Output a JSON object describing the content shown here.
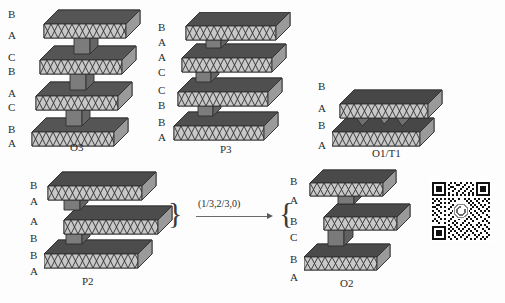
{
  "figure": {
    "background_color": "#fdfdfd",
    "polyhedra_light": "#c9c9c9",
    "polyhedra_mid": "#a8a8a8",
    "polyhedra_dark": "#7c7c7c",
    "outline_color": "#2f2f2f"
  },
  "structures": [
    {
      "id": "o3",
      "caption": "O3",
      "stacking_labels": [
        "B",
        "A",
        "C",
        "B",
        "A",
        "C",
        "B",
        "A"
      ],
      "layer_count": 4
    },
    {
      "id": "p3",
      "caption": "P3",
      "stacking_labels": [
        "B",
        "A",
        "A",
        "C",
        "C",
        "B",
        "B",
        "A"
      ],
      "layer_count": 4
    },
    {
      "id": "o1t1",
      "caption": "O1/T1",
      "stacking_labels": [
        "B",
        "A",
        "B",
        "A"
      ],
      "layer_count": 2
    },
    {
      "id": "p2",
      "caption": "P2",
      "stacking_labels": [
        "B",
        "A",
        "A",
        "B",
        "B",
        "A"
      ],
      "layer_count": 3
    },
    {
      "id": "o2",
      "caption": "O2",
      "stacking_labels": [
        "B",
        "A",
        "B",
        "C",
        "B",
        "A"
      ],
      "layer_count": 3
    }
  ],
  "transformation": {
    "arrow_label": "(1/3,2/3,0)",
    "left_brace": "}",
    "right_brace": "{"
  },
  "qr_code": {
    "present": true,
    "center_logo": "circular-logo"
  }
}
